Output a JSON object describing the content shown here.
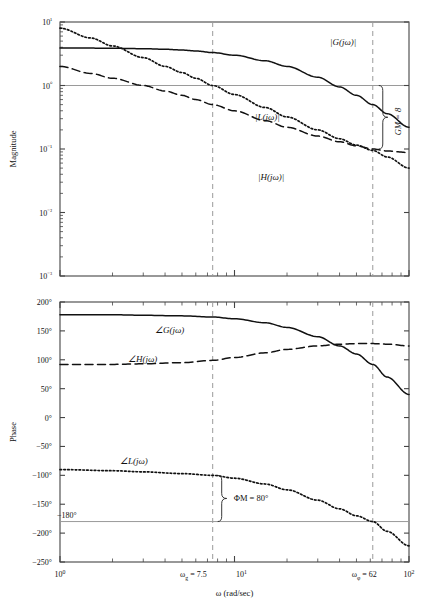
{
  "figure": {
    "name": "bode-plot-gain-phase-margin",
    "xlabel": "ω (rad/sec)",
    "panels": [
      "magnitude",
      "phase"
    ]
  },
  "magnitude_panel": {
    "ylabel": "Magnitude",
    "yticks": [
      "10¹",
      "10⁰",
      "10⁻¹",
      "10⁻²",
      "10⁻³"
    ],
    "curve_labels": {
      "G": "|G(jω)|",
      "L": "|L(jω)|",
      "H": "|H(jω)|"
    },
    "annotation": "GM = 8",
    "unity_line_label": "1"
  },
  "phase_panel": {
    "ylabel": "Phase",
    "yticks": [
      "200°",
      "150°",
      "100°",
      "50°",
      "0°",
      "−50°",
      "−100°",
      "−150°",
      "−200°",
      "−250°"
    ],
    "curve_labels": {
      "G": "∠G(jω)",
      "H": "∠H(jω)",
      "L": "∠L(jω)"
    },
    "annotation": "ΦM = 80°",
    "reference_line_label": "−180°"
  },
  "xaxis": {
    "label": "ω (rad/sec)",
    "ticks": [
      "10⁰",
      "10¹",
      "10²"
    ],
    "marker_gain_crossover": "ωg = 7.5",
    "marker_phase_crossover": "ωφ = 62"
  },
  "colors": {
    "curve": "#111111",
    "axis": "#444444",
    "reference_line": "#9a9a9a",
    "dashed_marker": "#9a9a9a",
    "background": "#ffffff"
  },
  "chart_data": {
    "type": "line",
    "title": "",
    "subtitle": "",
    "xlabel": "ω (rad/sec)",
    "xscale": "log",
    "xlim": [
      1,
      100
    ],
    "panels": [
      {
        "name": "magnitude",
        "ylabel": "Magnitude",
        "yscale": "log",
        "ylim": [
          0.001,
          10
        ],
        "yticks": [
          10,
          1,
          0.1,
          0.01,
          0.001
        ],
        "ytick_labels": [
          "10¹",
          "10⁰",
          "10⁻¹",
          "10⁻²",
          "10⁻³"
        ],
        "grid": false,
        "reference_lines": [
          {
            "y": 1,
            "label": "1",
            "style": "solid-gray"
          }
        ],
        "vertical_markers": [
          {
            "x": 7.5,
            "label": "ωg = 7.5",
            "style": "dashed"
          },
          {
            "x": 62,
            "label": "ωφ = 62",
            "style": "dashed"
          }
        ],
        "annotations": [
          {
            "text": "GM = 8",
            "x": 62,
            "y": 0.3,
            "orientation": "vertical"
          }
        ],
        "series": [
          {
            "name": "|G(jω)|",
            "style": "solid",
            "x": [
              1,
              1.5,
              2,
              3,
              4,
              5,
              6,
              7.5,
              10,
              15,
              20,
              30,
              40,
              50,
              62,
              75,
              100
            ],
            "y": [
              3.9,
              3.88,
              3.86,
              3.8,
              3.72,
              3.62,
              3.5,
              3.3,
              3.0,
              2.45,
              2.0,
              1.35,
              0.95,
              0.7,
              0.5,
              0.36,
              0.22
            ]
          },
          {
            "name": "|L(jω)|",
            "style": "dotted",
            "x": [
              1,
              1.5,
              2,
              3,
              4,
              5,
              6,
              7.5,
              10,
              15,
              20,
              30,
              40,
              50,
              62,
              75,
              100
            ],
            "y": [
              8.0,
              5.6,
              4.2,
              2.75,
              2.0,
              1.6,
              1.3,
              1.0,
              0.72,
              0.45,
              0.32,
              0.2,
              0.145,
              0.115,
              0.095,
              0.075,
              0.05
            ]
          },
          {
            "name": "|H(jω)|",
            "style": "dashed",
            "x": [
              1,
              1.5,
              2,
              3,
              4,
              5,
              6,
              7.5,
              10,
              15,
              20,
              30,
              40,
              50,
              62,
              75,
              100
            ],
            "y": [
              2.0,
              1.55,
              1.3,
              1.0,
              0.82,
              0.7,
              0.6,
              0.5,
              0.4,
              0.28,
              0.22,
              0.16,
              0.13,
              0.112,
              0.1,
              0.093,
              0.088
            ]
          }
        ]
      },
      {
        "name": "phase",
        "ylabel": "Phase",
        "yscale": "linear",
        "ylim": [
          -250,
          200
        ],
        "yticks": [
          200,
          150,
          100,
          50,
          0,
          -50,
          -100,
          -150,
          -200,
          -250
        ],
        "ytick_labels": [
          "200°",
          "150°",
          "100°",
          "50°",
          "0°",
          "−50°",
          "−100°",
          "−150°",
          "−200°",
          "−250°"
        ],
        "grid": false,
        "reference_lines": [
          {
            "y": -180,
            "label": "−180°",
            "style": "solid-gray"
          }
        ],
        "vertical_markers": [
          {
            "x": 7.5,
            "label": "ωg = 7.5",
            "style": "dashed"
          },
          {
            "x": 62,
            "label": "ωφ = 62",
            "style": "dashed"
          }
        ],
        "annotations": [
          {
            "text": "ΦM = 80°",
            "x": 7.5,
            "y": -140,
            "orientation": "horizontal"
          }
        ],
        "series": [
          {
            "name": "∠G(jω)",
            "style": "solid",
            "x": [
              1,
              2,
              3,
              5,
              7.5,
              10,
              15,
              20,
              30,
              40,
              50,
              62,
              75,
              100
            ],
            "y": [
              178,
              178,
              177,
              176,
              174,
              171,
              164,
              156,
              140,
              124,
              110,
              92,
              70,
              40
            ]
          },
          {
            "name": "∠H(jω)",
            "style": "dashed",
            "x": [
              1,
              2,
              3,
              5,
              7.5,
              10,
              15,
              20,
              30,
              40,
              50,
              62,
              75,
              100
            ],
            "y": [
              92,
              92,
              93,
              95,
              99,
              104,
              112,
              118,
              124,
              127,
              128,
              128,
              127,
              124
            ]
          },
          {
            "name": "∠L(jω)",
            "style": "dotted",
            "x": [
              1,
              2,
              3,
              5,
              7.5,
              10,
              15,
              20,
              30,
              40,
              50,
              62,
              75,
              100
            ],
            "y": [
              -90,
              -92,
              -94,
              -97,
              -100,
              -105,
              -115,
              -125,
              -143,
              -158,
              -170,
              -180,
              -197,
              -222
            ]
          }
        ]
      }
    ]
  }
}
